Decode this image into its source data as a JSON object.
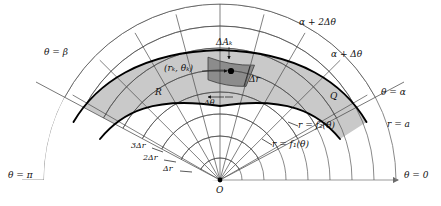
{
  "figure": {
    "type": "polar-area-partition-diagram",
    "background": "#ffffff",
    "line_color": "#3a3a3a",
    "bold_curve_color": "#000000",
    "shade_light": "#c9c9c9",
    "shade_dark": "#8f8f8f",
    "axis_color": "#9a9a9a"
  },
  "labels": {
    "theta_pi": "θ = π",
    "theta_zero": "θ = 0",
    "theta_beta": "θ = β",
    "theta_alpha": "θ = α",
    "alpha_plus_dtheta": "α + Δθ",
    "alpha_plus_2dtheta": "α + 2Δθ",
    "radius_a": "r = a",
    "curve_f1": "r = f₁(θ)",
    "curve_f2": "r = f₂(θ)",
    "region_R": "R",
    "region_Q": "Q",
    "delta_area": "ΔAₖ",
    "sample_point": "(rₖ, θₖ)",
    "delta_r": "Δr",
    "delta_theta": "Δθ",
    "two_delta_r": "2Δr",
    "three_delta_r": "3Δr",
    "origin": "O"
  },
  "geometry": {
    "origin_x": 220,
    "origin_y": 180,
    "outer_radius": 176,
    "ring_radii": [
      22,
      44,
      66,
      88,
      110,
      132,
      154,
      176
    ],
    "ray_angles_deg": [
      0,
      15,
      30,
      45,
      60,
      75,
      90,
      105,
      120,
      135,
      150,
      165,
      180
    ],
    "alpha_deg": 28,
    "beta_deg": 152,
    "delta_theta_deg": 15
  }
}
